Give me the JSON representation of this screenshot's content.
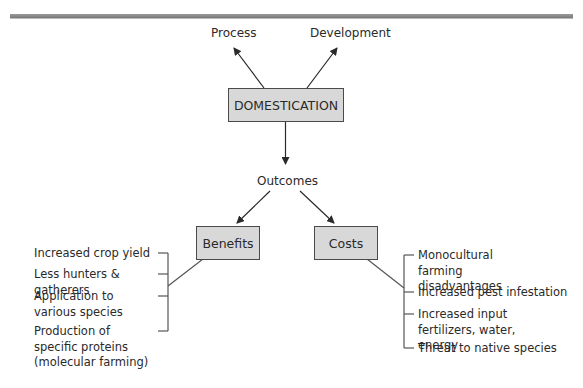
{
  "diagram": {
    "root": {
      "label": "DOMESTICATION"
    },
    "top_branches": [
      {
        "label": "Process"
      },
      {
        "label": "Development"
      }
    ],
    "middle": {
      "label": "Outcomes"
    },
    "categories": [
      {
        "label": "Benefits",
        "items": [
          {
            "label": "Increased crop yield"
          },
          {
            "label": "Less hunters & gatherers"
          },
          {
            "label": "Application to various species"
          },
          {
            "label": "Production of specific proteins (molecular farming)"
          }
        ]
      },
      {
        "label": "Costs",
        "items": [
          {
            "label": "Monocultural farming disadvantages"
          },
          {
            "label": "Increased pest infestation"
          },
          {
            "label": "Increased input fertilizers, water, energy"
          },
          {
            "label": "Threat to native species"
          }
        ]
      }
    ],
    "colors": {
      "box_fill": "#d8d8d8",
      "box_border": "#4a4a4a",
      "line": "#2a2a2a",
      "bracket": "#555555",
      "top_rule": "#8a8a8a"
    }
  }
}
